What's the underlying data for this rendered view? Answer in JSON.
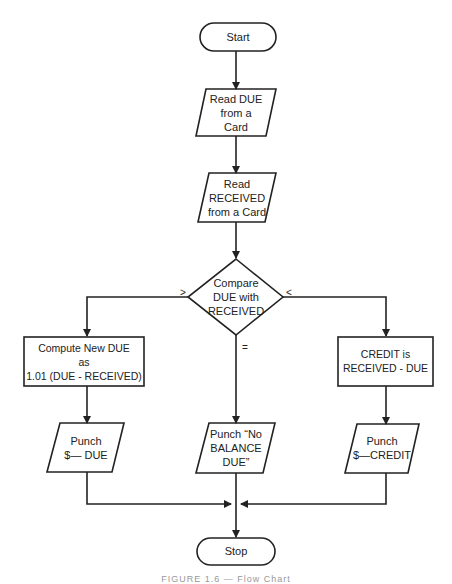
{
  "diagram": {
    "nodes": {
      "start": {
        "type": "terminator",
        "label": "Start"
      },
      "read_due": {
        "type": "io",
        "lines": [
          "Read DUE",
          "from a",
          "Card"
        ]
      },
      "read_received": {
        "type": "io",
        "lines": [
          "Read",
          "RECEIVED",
          "from a Card"
        ]
      },
      "compare": {
        "type": "decision",
        "lines": [
          "Compare",
          "DUE with",
          "RECEIVED"
        ]
      },
      "compute_due": {
        "type": "process",
        "lines": [
          "Compute New DUE",
          "as",
          "1.01 (DUE - RECEIVED)"
        ]
      },
      "credit": {
        "type": "process",
        "lines": [
          "CREDIT is",
          "RECEIVED - DUE"
        ]
      },
      "punch_due": {
        "type": "io",
        "lines": [
          "Punch",
          "$— DUE"
        ]
      },
      "punch_no_balance": {
        "type": "io",
        "lines": [
          "Punch “No",
          "BALANCE",
          "DUE”"
        ]
      },
      "punch_credit": {
        "type": "io",
        "lines": [
          "Punch",
          "$—CREDIT"
        ]
      },
      "stop": {
        "type": "terminator",
        "label": "Stop"
      }
    },
    "branch_labels": {
      "greater": ">",
      "less": "<",
      "equal": "="
    },
    "edges": [
      {
        "from": "start",
        "to": "read_due"
      },
      {
        "from": "read_due",
        "to": "read_received"
      },
      {
        "from": "read_received",
        "to": "compare"
      },
      {
        "from": "compare",
        "to": "compute_due",
        "label": ">"
      },
      {
        "from": "compare",
        "to": "punch_no_balance",
        "label": "="
      },
      {
        "from": "compare",
        "to": "credit",
        "label": "<"
      },
      {
        "from": "compute_due",
        "to": "punch_due"
      },
      {
        "from": "credit",
        "to": "punch_credit"
      },
      {
        "from": "punch_due",
        "to": "stop"
      },
      {
        "from": "punch_no_balance",
        "to": "stop"
      },
      {
        "from": "punch_credit",
        "to": "stop"
      }
    ]
  },
  "caption": "FIGURE 1.6 — Flow Chart"
}
